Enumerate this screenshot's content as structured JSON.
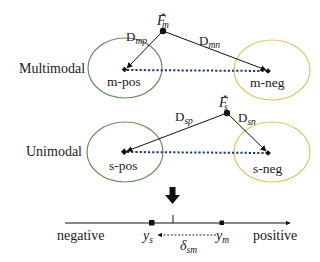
{
  "diagram": {
    "rows": {
      "multimodal": {
        "label": "Multimodal",
        "anchor": {
          "symbol": "F",
          "sub": "m",
          "sup": "*"
        },
        "positive_cluster": {
          "label": "m-pos",
          "color": "#6b8f5e"
        },
        "negative_cluster": {
          "label": "m-neg",
          "color": "#e3c46a"
        },
        "distance_to_positive": {
          "symbol": "D",
          "sub": "mp"
        },
        "distance_to_negative": {
          "symbol": "D",
          "sub": "mn"
        }
      },
      "unimodal": {
        "label": "Unimodal",
        "anchor": {
          "symbol": "F",
          "sub": "s",
          "sup": "*"
        },
        "positive_cluster": {
          "label": "s-pos",
          "color": "#6b8f5e"
        },
        "negative_cluster": {
          "label": "s-neg",
          "color": "#e3c46a"
        },
        "distance_to_positive": {
          "symbol": "D",
          "sub": "sp"
        },
        "distance_to_negative": {
          "symbol": "D",
          "sub": "sn"
        }
      }
    },
    "axis": {
      "left_label": "negative",
      "right_label": "positive",
      "points": [
        {
          "symbol": "y",
          "sub": "s"
        },
        {
          "symbol": "y",
          "sub": "m"
        }
      ],
      "offset": {
        "symbol": "δ",
        "sub": "sm"
      }
    },
    "colors": {
      "positive_ellipse": "#6b8f5e",
      "negative_ellipse": "#e3c46a",
      "dotted_link": "#1f3b7a",
      "ink": "#111111"
    }
  }
}
